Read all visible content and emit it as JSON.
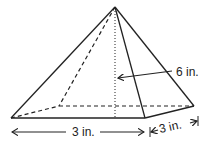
{
  "figure": {
    "type": "square pyramid",
    "labels": {
      "height": "6 in.",
      "base_length": "3 in.",
      "base_width": "3 in."
    },
    "colors": {
      "stroke": "#222222",
      "background": "#ffffff"
    }
  }
}
